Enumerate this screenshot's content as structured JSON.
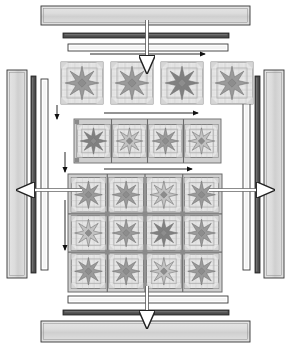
{
  "diagram": {
    "type": "quilt-assembly",
    "canvas": {
      "width": 291,
      "height": 348
    },
    "colors": {
      "background": "#ffffff",
      "border_strip_light": "#d9d9d9",
      "border_strip_light_edge": "#3a3a3a",
      "inner_strip_dark": "#4d4d4d",
      "inner_strip_white": "#ffffff",
      "sashing": "#cfcfcf",
      "sashing_line": "#6b6b6b",
      "block_background": "#e8e8e8",
      "star_light": "#c2c2c2",
      "star_medium": "#9a9a9a",
      "star_dark": "#808080",
      "block_outline": "#5a5a5a",
      "arrow_black": "#111111",
      "arrow_white": "#ffffff",
      "arrow_white_outline": "#222222",
      "cornerstone": "#8a8a8a"
    },
    "border_strips": {
      "top": [
        {
          "name": "outer-border-top",
          "style": "wide-light",
          "x": 41,
          "y": 6,
          "w": 209,
          "h": 19
        },
        {
          "name": "inner-border-dark-top",
          "style": "narrow-dark",
          "x": 63,
          "y": 33,
          "w": 166,
          "h": 5
        },
        {
          "name": "inner-border-white-top",
          "style": "narrow-white",
          "x": 68,
          "y": 44,
          "w": 160,
          "h": 7
        }
      ],
      "bottom": [
        {
          "name": "inner-border-white-bottom",
          "style": "narrow-white",
          "x": 68,
          "y": 296,
          "w": 160,
          "h": 7
        },
        {
          "name": "inner-border-dark-bottom",
          "style": "narrow-dark",
          "x": 63,
          "y": 310,
          "w": 166,
          "h": 5
        },
        {
          "name": "outer-border-bottom",
          "style": "wide-light",
          "x": 41,
          "y": 321,
          "w": 209,
          "h": 21
        }
      ],
      "left": [
        {
          "name": "outer-border-left",
          "style": "wide-light",
          "x": 7,
          "y": 70,
          "w": 20,
          "h": 208
        },
        {
          "name": "inner-border-dark-left",
          "style": "narrow-dark",
          "x": 31,
          "y": 76,
          "w": 5,
          "h": 197
        },
        {
          "name": "inner-border-white-left",
          "style": "narrow-white",
          "x": 41,
          "y": 79,
          "w": 7,
          "h": 191
        }
      ],
      "right": [
        {
          "name": "inner-border-white-right",
          "style": "narrow-white",
          "x": 243,
          "y": 79,
          "w": 7,
          "h": 191
        },
        {
          "name": "inner-border-dark-right",
          "style": "narrow-dark",
          "x": 255,
          "y": 76,
          "w": 5,
          "h": 197
        },
        {
          "name": "outer-border-right",
          "style": "wide-light",
          "x": 264,
          "y": 70,
          "w": 20,
          "h": 208
        }
      ]
    },
    "block_row_top": {
      "label": "separate-blocks-row",
      "count": 4,
      "y": 62,
      "size": 42,
      "gap": 8,
      "x_start": 61,
      "blocks": [
        {
          "star_tone": "medium"
        },
        {
          "star_tone": "medium"
        },
        {
          "star_tone": "dark"
        },
        {
          "star_tone": "medium"
        }
      ]
    },
    "block_row_middle": {
      "label": "sashed-block-row",
      "count": 4,
      "x": 74,
      "y": 119,
      "w": 147,
      "h": 44,
      "blocks": [
        {
          "star_tone": "dark"
        },
        {
          "star_tone": "light"
        },
        {
          "star_tone": "medium"
        },
        {
          "star_tone": "light"
        }
      ]
    },
    "quilt_center": {
      "label": "quilt-center",
      "x": 68,
      "y": 174,
      "w": 154,
      "h": 118,
      "columns": 4,
      "rows": 3,
      "blocks": [
        [
          {
            "star_tone": "medium"
          },
          {
            "star_tone": "medium"
          },
          {
            "star_tone": "light"
          },
          {
            "star_tone": "medium"
          }
        ],
        [
          {
            "star_tone": "light"
          },
          {
            "star_tone": "medium"
          },
          {
            "star_tone": "dark"
          },
          {
            "star_tone": "medium"
          }
        ],
        [
          {
            "star_tone": "medium"
          },
          {
            "star_tone": "medium"
          },
          {
            "star_tone": "light"
          },
          {
            "star_tone": "medium"
          }
        ]
      ]
    },
    "arrows": {
      "black": [
        {
          "name": "arrow-row-top-right",
          "direction": "right",
          "x1": 90,
          "y1": 54,
          "x2": 205,
          "y2": 54
        },
        {
          "name": "arrow-row-top-down",
          "direction": "down",
          "x1": 57,
          "y1": 105,
          "x2": 57,
          "y2": 119
        },
        {
          "name": "arrow-row-middle-right",
          "direction": "right",
          "x1": 104,
          "y1": 113,
          "x2": 198,
          "y2": 113
        },
        {
          "name": "arrow-row-middle-down",
          "direction": "down",
          "x1": 65,
          "y1": 152,
          "x2": 65,
          "y2": 172
        },
        {
          "name": "arrow-center-top-right",
          "direction": "right",
          "x1": 104,
          "y1": 169,
          "x2": 192,
          "y2": 169
        },
        {
          "name": "arrow-center-left-down",
          "direction": "down",
          "x1": 65,
          "y1": 200,
          "x2": 65,
          "y2": 250
        }
      ],
      "white": [
        {
          "name": "arrow-top-border-down",
          "direction": "down",
          "x1": 147,
          "y1": 20,
          "x2": 147,
          "y2": 72
        },
        {
          "name": "arrow-bottom-border-down",
          "direction": "down",
          "x1": 147,
          "y1": 286,
          "x2": 147,
          "y2": 327
        },
        {
          "name": "arrow-left-border-left",
          "direction": "left",
          "x1": 82,
          "y1": 190,
          "x2": 18,
          "y2": 190
        },
        {
          "name": "arrow-right-border-right",
          "direction": "right",
          "x1": 209,
          "y1": 190,
          "x2": 273,
          "y2": 190
        }
      ]
    }
  }
}
